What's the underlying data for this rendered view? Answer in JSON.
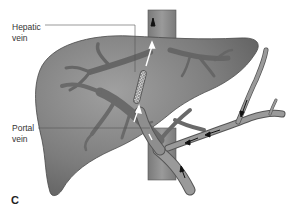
{
  "figure": {
    "panel_letter": "C",
    "labels": {
      "hepatic_vein": "Hepatic\nvein",
      "portal_vein": "Portal\nvein"
    },
    "structures": [
      "liver",
      "inferior-vena-cava",
      "hepatic-vein-branches",
      "portal-vein-branches",
      "tips-stent-shunt",
      "splenic-vein",
      "superior-mesenteric-vein",
      "blood-flow-arrows"
    ],
    "colors": {
      "liver_fill": "#7a7a7a",
      "liver_highlight": "#9a9a9a",
      "liver_outline": "#4a4a4a",
      "vessel_fill": "#8e8e8e",
      "vessel_dark": "#5e5e5e",
      "ivc_fill": "#8a8a8a",
      "leader_line": "#555555",
      "arrow_white": "#ffffff",
      "arrow_black": "#111111"
    }
  }
}
